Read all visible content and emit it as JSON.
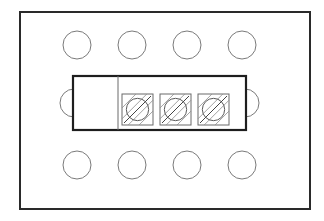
{
  "diagram": {
    "type": "terminal-block-layout",
    "colors": {
      "background": "#ffffff",
      "frame": "#2a2a2a",
      "hole": "#7a7a7a",
      "block": "#1e1e1e",
      "terminal": "#6a6a6a"
    },
    "frame": {
      "x": 20,
      "y": 12,
      "width": 290,
      "height": 197
    },
    "mounting_holes": {
      "radius": 14,
      "top_row": [
        {
          "cx": 77,
          "cy": 45
        },
        {
          "cx": 132,
          "cy": 45
        },
        {
          "cx": 187,
          "cy": 45
        },
        {
          "cx": 242,
          "cy": 45
        }
      ],
      "bottom_row": [
        {
          "cx": 77,
          "cy": 165
        },
        {
          "cx": 132,
          "cy": 165
        },
        {
          "cx": 187,
          "cy": 165
        },
        {
          "cx": 242,
          "cy": 165
        }
      ],
      "side": [
        {
          "cx": 74,
          "cy": 103,
          "side": "left"
        },
        {
          "cx": 245,
          "cy": 103,
          "side": "right"
        }
      ]
    },
    "terminal_block": {
      "x": 73,
      "y": 76,
      "width": 173,
      "height": 54,
      "divider_x": 118,
      "terminals": [
        {
          "id": "T1",
          "x": 122,
          "y": 94,
          "size": 31
        },
        {
          "id": "T2",
          "x": 160,
          "y": 94,
          "size": 31
        },
        {
          "id": "T3",
          "x": 198,
          "y": 94,
          "size": 31
        }
      ]
    }
  }
}
